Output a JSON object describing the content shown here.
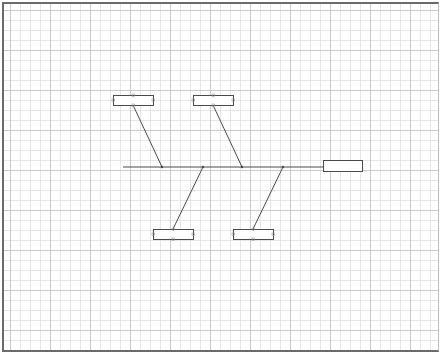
{
  "diagram": {
    "type": "fishbone",
    "colors": {
      "line": "#4a4a4a",
      "box_stroke": "#4a4a4a",
      "box_fill": "#ffffff",
      "handle": "#9a9a9a"
    },
    "spine": {
      "x1": 123,
      "y1": 167,
      "x2": 323,
      "y2": 167
    },
    "head": {
      "x": 323,
      "y": 160,
      "w": 39,
      "h": 11,
      "label": ""
    },
    "bones": [
      {
        "id": "top-1",
        "box": {
          "x": 113,
          "y": 95,
          "w": 40,
          "h": 10,
          "label": ""
        },
        "from": [
          133,
          105
        ],
        "to": [
          162,
          167
        ]
      },
      {
        "id": "top-2",
        "box": {
          "x": 193,
          "y": 95,
          "w": 40,
          "h": 10,
          "label": ""
        },
        "from": [
          213,
          105
        ],
        "to": [
          242,
          167
        ]
      },
      {
        "id": "bottom-1",
        "box": {
          "x": 153,
          "y": 229,
          "w": 40,
          "h": 10,
          "label": ""
        },
        "from": [
          173,
          229
        ],
        "to": [
          203,
          167
        ]
      },
      {
        "id": "bottom-2",
        "box": {
          "x": 233,
          "y": 229,
          "w": 40,
          "h": 10,
          "label": ""
        },
        "from": [
          253,
          229
        ],
        "to": [
          283,
          167
        ]
      }
    ]
  }
}
